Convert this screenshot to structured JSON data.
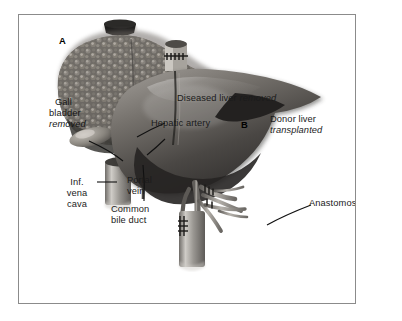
{
  "figure": {
    "kind": "medical-illustration",
    "background_color": "#ffffff",
    "frame_color": "#8b8b8b",
    "text_color": "#1b1b1b"
  },
  "panels": [
    {
      "id": "A",
      "marker": "A",
      "caption": "Diseased liver removed"
    },
    {
      "id": "B",
      "marker": "B",
      "caption_line1": "Donor liver",
      "caption_line2": "transplanted"
    }
  ],
  "labels": {
    "panel_a_marker": "A",
    "panel_b_marker": "B",
    "gall_bladder_l1": "Gall",
    "gall_bladder_l2": "bladder",
    "gall_bladder_l3": "removed",
    "diseased_liver": "Diseased liver",
    "diseased_liver_state": "removed",
    "hepatic_artery": "Hepatic artery",
    "donor_liver": "Donor liver",
    "donor_liver_state": "transplanted",
    "inf_vena_cava_l1": "Inf.",
    "inf_vena_cava_l2": "vena",
    "inf_vena_cava_l3": "cava",
    "portal_vein_l1": "Portal",
    "portal_vein_l2": "vein",
    "common_bile_duct_l1": "Common",
    "common_bile_duct_l2": "bile duct",
    "anastomoses": "Anastomoses"
  },
  "structures": {
    "diseased_liver_texture": "nodular-cirrhotic",
    "donor_liver_texture": "smooth-healthy",
    "vessels": [
      "inferior vena cava",
      "portal vein",
      "hepatic artery",
      "common bile duct"
    ],
    "suture_marks": "anastomosis-stitches"
  },
  "colors": {
    "liver_dark": "#3c3a38",
    "liver_mid": "#6d6a66",
    "liver_light": "#a9a5a0",
    "nodule_highlight": "#cfcbc4",
    "vessel_gray": "#8e8b87",
    "ivc_stump": "#1d1c1b"
  }
}
